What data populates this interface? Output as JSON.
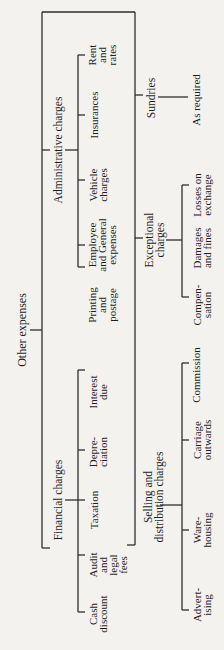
{
  "diagram": {
    "type": "tree",
    "orientation": "rotated-90-ccw",
    "root": {
      "label": "Other expenses"
    },
    "branches": {
      "administrative": {
        "label": "Administrative charges",
        "children": [
          {
            "label": "Rent\nand\nrates"
          },
          {
            "label": "Insurances"
          },
          {
            "label": "Vehicle\ncharges"
          },
          {
            "label": "Employee\nand General\nexpenses"
          },
          {
            "label": "Printing\nand\npostage"
          }
        ]
      },
      "financial": {
        "label": "Financial charges",
        "children": [
          {
            "label": "Interest\ndue"
          },
          {
            "label": "Depre-\nciation"
          },
          {
            "label": "Taxation"
          },
          {
            "label": "Audit\nand\nlegal\nfees"
          },
          {
            "label": "Cash\ndiscount"
          }
        ]
      },
      "sundries": {
        "label": "Sundries",
        "children": [
          {
            "label": "As required"
          }
        ]
      },
      "exceptional": {
        "label": "Exceptional\ncharges",
        "children": [
          {
            "label": "Losses on\nexchange"
          },
          {
            "label": "Damages\nand fines"
          },
          {
            "label": "Compen-\nsation"
          }
        ]
      },
      "selling": {
        "label": "Selling and\ndistribution charges",
        "children": [
          {
            "label": "Commission"
          },
          {
            "label": "Carriage\noutwards"
          },
          {
            "label": "Ware-\nhousing"
          },
          {
            "label": "Advert-\nising"
          }
        ]
      }
    },
    "colors": {
      "background": "#f3f2ef",
      "line": "#2d2d2d",
      "text": "#1e1e1e"
    }
  }
}
